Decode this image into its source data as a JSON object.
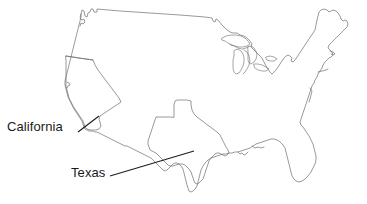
{
  "figure": {
    "type": "map",
    "region": "Contiguous United States",
    "background_color": "#ffffff",
    "outline_color": "#6e6e6e",
    "label_color": "#1a1a1a",
    "leader_line_color": "#1d1d1d",
    "width": 367,
    "height": 204
  },
  "labels": [
    {
      "id": "california",
      "text": "California",
      "text_x": 7,
      "text_y": 120,
      "leader_from_x": 78,
      "leader_from_y": 132,
      "leader_to_x": 99,
      "leader_to_y": 116
    },
    {
      "id": "texas",
      "text": "Texas",
      "text_x": 71,
      "text_y": 166,
      "leader_from_x": 110,
      "leader_from_y": 176,
      "leader_to_x": 194,
      "leader_to_y": 151
    }
  ],
  "highlighted_states": [
    {
      "name": "California",
      "label": "California"
    },
    {
      "name": "Texas",
      "label": "Texas"
    }
  ]
}
